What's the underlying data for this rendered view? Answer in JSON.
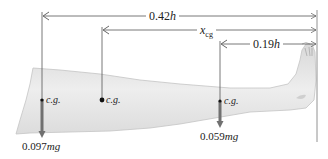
{
  "diagram": {
    "type": "leg-center-of-gravity",
    "dimensions": {
      "total": {
        "value": "0.42",
        "unit": "h",
        "label": "0.42h"
      },
      "xcg": {
        "symbol": "x",
        "subscript": "cg",
        "label": "x_cg"
      },
      "foot": {
        "value": "0.19",
        "unit": "h",
        "label": "0.19h"
      }
    },
    "cg_points": [
      {
        "label": "c.g.",
        "weight": "0.097",
        "weight_unit": "mg",
        "has_arrow": true
      },
      {
        "label": "c.g.",
        "weight": null,
        "has_arrow": false
      },
      {
        "label": "c.g.",
        "weight": "0.059",
        "weight_unit": "mg",
        "has_arrow": true
      }
    ],
    "colors": {
      "leg_fill": "#e4e4e4",
      "leg_edge": "#b8b8b8",
      "line": "#555555",
      "arrow": "#6e6e6e",
      "text": "#222222"
    }
  }
}
